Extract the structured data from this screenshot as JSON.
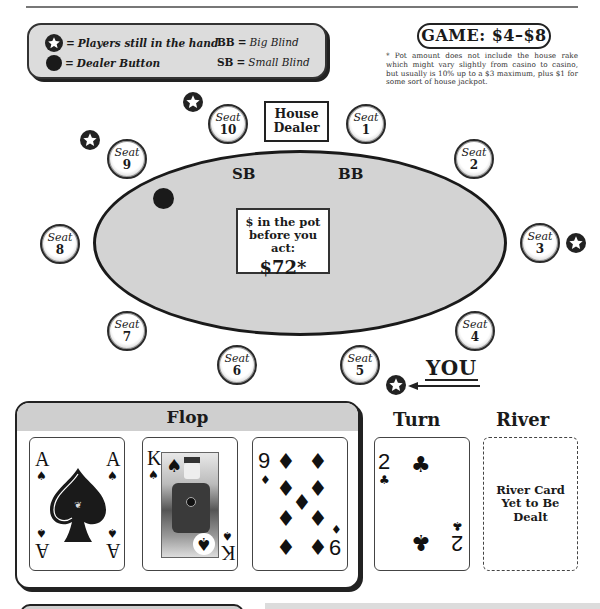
{
  "legend": {
    "players_in_hand": {
      "icon": "star-icon",
      "eq": "=",
      "text": "Players still in the hand"
    },
    "dealer_button": {
      "icon": "dealer-button-icon",
      "eq": "=",
      "text": "Dealer Button"
    },
    "big_blind": {
      "abbr": "BB",
      "eq": "=",
      "text": "Big Blind"
    },
    "small_blind": {
      "abbr": "SB",
      "eq": "=",
      "text": "Small Blind"
    }
  },
  "game": {
    "label": "GAME: $4–$8",
    "footnote": "* Pot amount does not include the house rake which might vary slightly from casino to casino, but usually is 10% up to a $3 maximum, plus $1 for some sort of house jackpot."
  },
  "table": {
    "house_dealer": [
      "House",
      "Dealer"
    ],
    "small_blind_label": "SB",
    "big_blind_label": "BB",
    "pot": {
      "line1": "$ in the pot",
      "line2": "before you act:",
      "amount": "$72*"
    },
    "seat_prefix": "Seat",
    "seats": [
      {
        "num": "1"
      },
      {
        "num": "2"
      },
      {
        "num": "3"
      },
      {
        "num": "4"
      },
      {
        "num": "5"
      },
      {
        "num": "6"
      },
      {
        "num": "7"
      },
      {
        "num": "8"
      },
      {
        "num": "9"
      },
      {
        "num": "10"
      }
    ],
    "players_in_hand_seats": [
      "3",
      "5",
      "9",
      "10"
    ],
    "dealer_button_seat": "9",
    "you_label": "YOU",
    "you_seat": "5"
  },
  "board": {
    "flop_title": "Flop",
    "flop": [
      {
        "rank": "A",
        "suit": "♠",
        "suit_name": "spades"
      },
      {
        "rank": "K",
        "suit": "♠",
        "suit_name": "spades"
      },
      {
        "rank": "9",
        "suit": "♦",
        "suit_name": "diamonds"
      }
    ],
    "turn_title": "Turn",
    "turn": {
      "rank": "2",
      "suit": "♣",
      "suit_name": "clubs"
    },
    "river_title": "River",
    "river_placeholder": "River Card Yet to Be Dealt"
  },
  "colors": {
    "table_felt": "#d3d3d3",
    "legend_bg": "#dcdcdc",
    "ink": "#1a1a1a"
  }
}
